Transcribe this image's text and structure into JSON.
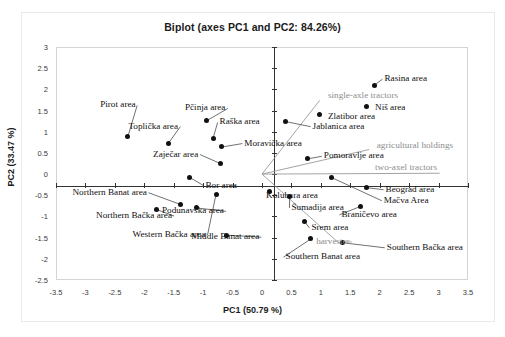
{
  "chart_data": {
    "type": "scatter",
    "title": "Biplot (axes PC1 and PC2: 84.26%)",
    "xlabel": "PC1 (50.79 %)",
    "ylabel": "PC2 (33.47 %)",
    "xlim": [
      -3.5,
      3.5
    ],
    "ylim": [
      -2.5,
      3
    ],
    "xticks": [
      "-3.5",
      "-3",
      "-2.5",
      "-2",
      "-1.5",
      "-1",
      "-0.5",
      "0",
      "0.5",
      "1",
      "1.5",
      "2",
      "2.5",
      "3",
      "3.5"
    ],
    "yticks": [
      "3",
      "2.5",
      "2",
      "1.5",
      "1",
      "0.5",
      "0",
      "-0.5",
      "-1",
      "-1.5",
      "-2",
      "-2.5"
    ],
    "grid": false,
    "legend": "none",
    "observations": [
      {
        "label": "Pirot area",
        "x": -2.28,
        "y": 0.88,
        "lx": -2.75,
        "ly": 1.62,
        "anchor": "start"
      },
      {
        "label": "Toplička area",
        "x": -1.59,
        "y": 0.73,
        "lx": -2.27,
        "ly": 1.12,
        "anchor": "start"
      },
      {
        "label": "Pčinja area",
        "x": -0.94,
        "y": 1.26,
        "lx": -1.31,
        "ly": 1.55,
        "anchor": "start"
      },
      {
        "label": "Raška area",
        "x": -0.83,
        "y": 0.85,
        "lx": -0.72,
        "ly": 1.22,
        "anchor": "start"
      },
      {
        "label": "Moravička area",
        "x": -0.68,
        "y": 0.64,
        "lx": -0.3,
        "ly": 0.72,
        "anchor": "start"
      },
      {
        "label": "Zaječar area",
        "x": -0.71,
        "y": 0.25,
        "lx": -1.85,
        "ly": 0.46,
        "anchor": "start"
      },
      {
        "label": "Jablanica area",
        "x": 0.4,
        "y": 1.24,
        "lx": 0.86,
        "ly": 1.12,
        "anchor": "start"
      },
      {
        "label": "Zlatibor area",
        "x": 0.98,
        "y": 1.41,
        "lx": 1.12,
        "ly": 1.35,
        "anchor": "start"
      },
      {
        "label": "Niš area",
        "x": 1.77,
        "y": 1.6,
        "lx": 1.92,
        "ly": 1.56,
        "anchor": "start"
      },
      {
        "label": "Rasina area",
        "x": 1.91,
        "y": 2.1,
        "lx": 2.08,
        "ly": 2.24,
        "anchor": "start"
      },
      {
        "label": "Pomoravlje area",
        "x": 0.78,
        "y": 0.36,
        "lx": 1.05,
        "ly": 0.42,
        "anchor": "start"
      },
      {
        "label": "Bor area",
        "x": -1.24,
        "y": -0.07,
        "lx": -0.96,
        "ly": -0.27,
        "anchor": "start"
      },
      {
        "label": "Kolubara area",
        "x": 0.13,
        "y": -0.42,
        "lx": 0.07,
        "ly": -0.52,
        "anchor": "start"
      },
      {
        "label": "Northern Banat area",
        "x": -1.38,
        "y": -0.72,
        "lx": -3.22,
        "ly": -0.44,
        "anchor": "start"
      },
      {
        "label": "Northern Bačka area",
        "x": -1.8,
        "y": -0.83,
        "lx": -2.82,
        "ly": -0.99,
        "anchor": "start"
      },
      {
        "label": "Podunavska area",
        "x": -1.11,
        "y": -0.8,
        "lx": -1.7,
        "ly": -0.88,
        "anchor": "start"
      },
      {
        "label": "Western Bačka area",
        "x": -0.78,
        "y": -0.47,
        "lx": -2.2,
        "ly": -1.44,
        "anchor": "start"
      },
      {
        "label": "Middle Banat area",
        "x": -0.61,
        "y": -1.44,
        "lx": -1.2,
        "ly": -1.49,
        "anchor": "start"
      },
      {
        "label": "Šumadija area",
        "x": 0.47,
        "y": -0.54,
        "lx": 0.5,
        "ly": -0.8,
        "anchor": "start"
      },
      {
        "label": "Braničevo area",
        "x": 1.68,
        "y": -0.76,
        "lx": 1.35,
        "ly": -0.96,
        "anchor": "start"
      },
      {
        "label": "Mačva Area",
        "x": 1.18,
        "y": -0.08,
        "lx": 2.07,
        "ly": -0.63,
        "anchor": "start"
      },
      {
        "label": "Beograd area",
        "x": 1.78,
        "y": -0.32,
        "lx": 2.1,
        "ly": -0.37,
        "anchor": "start"
      },
      {
        "label": "Srem area",
        "x": 0.72,
        "y": -1.12,
        "lx": 0.84,
        "ly": -1.27,
        "anchor": "start"
      },
      {
        "label": "Southern Banat area",
        "x": 0.83,
        "y": -1.53,
        "lx": 0.4,
        "ly": -1.96,
        "anchor": "start"
      },
      {
        "label": "Southern Bačka area",
        "x": 1.37,
        "y": -1.62,
        "lx": 2.12,
        "ly": -1.74,
        "anchor": "start"
      }
    ],
    "variables": [
      {
        "label": "single-axle tractors",
        "x": 0.98,
        "y": 1.74,
        "lx": 1.12,
        "ly": 1.84,
        "anchor": "start"
      },
      {
        "label": "agricultural holdings",
        "x": 1.82,
        "y": 0.58,
        "lx": 1.95,
        "ly": 0.66,
        "anchor": "start"
      },
      {
        "label": "two-axel tractors",
        "x": 3.02,
        "y": 0.02,
        "lx": 1.92,
        "ly": 0.14,
        "anchor": "start"
      },
      {
        "label": "harvester",
        "x": 1.3,
        "y": -1.62,
        "lx": 0.92,
        "ly": -1.6,
        "anchor": "start"
      }
    ],
    "colors": {
      "observation_marker": "#111111",
      "observation_text": "#101010",
      "variable_text": "#8e8e8e",
      "variable_vector": "#9a9a9a",
      "axis": "#333333",
      "frame": "#d4d4d4"
    }
  }
}
